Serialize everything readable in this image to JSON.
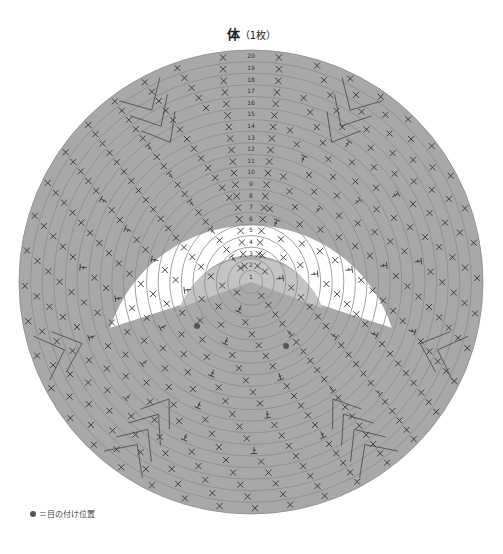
{
  "title": {
    "main": "体",
    "sub": "（1枚）"
  },
  "legend": {
    "symbol": "●",
    "text": "＝目の付け位置"
  },
  "diagram": {
    "type": "crochet-round-chart",
    "center": [
      251,
      282
    ],
    "outer_radius": 232,
    "round_count": 20,
    "round_labels": [
      "1",
      "2",
      "3",
      "4",
      "5",
      "6",
      "7",
      "8",
      "9",
      "10",
      "11",
      "12",
      "13",
      "14",
      "15",
      "16",
      "17",
      "18",
      "19",
      "20"
    ],
    "colors": {
      "body": "#a8a8a8",
      "face": "#c4c4c4",
      "muzzle": "#ffffff",
      "ring_line": "#8a8a8a",
      "stitch": "#333333",
      "eye": "#555555"
    },
    "face_sector": {
      "start_deg": 200,
      "end_deg": 340,
      "inner_r": 0,
      "outer_r": 70
    },
    "muzzle_sector": {
      "start_deg": 198,
      "end_deg": 342,
      "inner_r": 70,
      "outer_r": 148
    },
    "eyes": [
      {
        "x": 197,
        "y": 326
      },
      {
        "x": 286,
        "y": 346
      }
    ]
  }
}
